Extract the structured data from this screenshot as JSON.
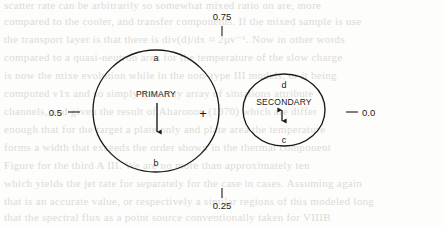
{
  "figure": {
    "background_color": "#fdfdfb",
    "ink_color": "#1b1b1b"
  },
  "axis_ticks": [
    {
      "name": "top",
      "label": "0.75",
      "x": 222,
      "y": 14,
      "tick": "vertical",
      "label_pos": "above"
    },
    {
      "name": "left",
      "label": "0.5",
      "x": 58,
      "y": 113,
      "tick": "horizontal",
      "label_pos": "left"
    },
    {
      "name": "right",
      "label": "0.0",
      "x": 392,
      "y": 113,
      "tick": "horizontal",
      "label_pos": "right"
    },
    {
      "name": "bottom",
      "label": "0.25",
      "x": 222,
      "y": 212,
      "tick": "vertical",
      "label_pos": "below"
    }
  ],
  "circles": [
    {
      "name": "primary",
      "title": "PRIMARY",
      "cx": 156,
      "cy": 111,
      "rx": 63,
      "ry": 61,
      "top_label": "a",
      "bottom_label": "b",
      "marker": "+",
      "marker_x": 203,
      "marker_y": 114,
      "arrow": {
        "x": 157,
        "y_top": 103,
        "y_bottom": 133,
        "heads": "down"
      }
    },
    {
      "name": "secondary",
      "title": "SECONDARY",
      "cx": 284,
      "cy": 110,
      "rx": 41,
      "ry": 36,
      "top_label": "d",
      "bottom_label": "c",
      "marker": "",
      "arrow": {
        "x": 282,
        "y_top": 106,
        "y_bottom": 122,
        "heads": "both"
      }
    }
  ],
  "background_text": {
    "lines": [
      "scatter rate can be arbitrarily so  somewhat mixed ratio on are, more",
      "compared to the cooler, and transfer components. If the mixed sample is use",
      "the transport layer is that there is div(d)/dx ≈ 2μv⁻¹. Now in other words",
      "compared to a quasi-neutron area for the temperature of the slow charge",
      "is now the mixe evolution while in the non–type III models, or it being",
      "computed v1x  and so simply  the array array of situations  attribute",
      "channels, and given the result of Aharonov  (1970) which are differ",
      "enough that for the target a plate only and plate area the temperature",
      "forms a width that exceeds the order shown in the thermal component",
      "Figure for  the  third  A III.    We  are  no  more  than  approximately  ten",
      "which yields the jet rate for separately for the case in cases.  Assuming again",
      "that is an accurate value, or respectively a similar regions of this modeled long",
      "that the  spectral flux  as  a  point  source  conventionally  taken  for  VIIIB",
      "and thus  should be  brighter than  the maximum  If  an equal  at the observed",
      "sampling of VIIIB Opt ID ≤ 33° and  Billiard’s (1988) estimate of the ICI E-I"
    ]
  }
}
